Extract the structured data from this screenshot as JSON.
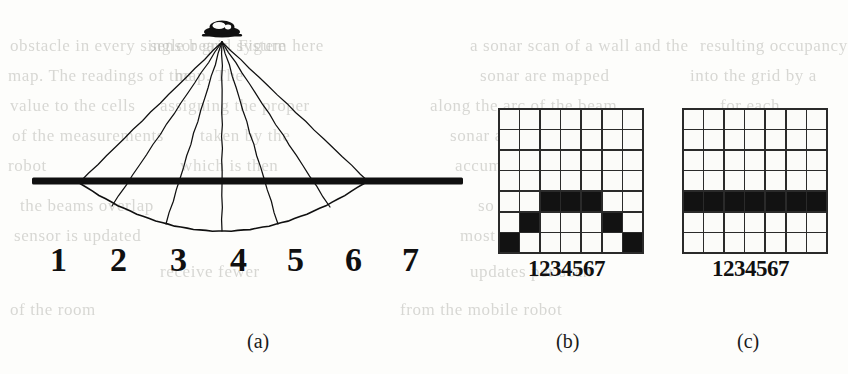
{
  "figure": {
    "background_color": "#fdfdfb",
    "ink_color": "#101010"
  },
  "ghost_text": {
    "note": "faint illegible show-through text from reverse side of scanned page",
    "lines": [
      {
        "text": "obstacle in every single beam. Figure",
        "x": 10,
        "y": 36
      },
      {
        "text": "sensor grid system here",
        "x": 150,
        "y": 36
      },
      {
        "text": "a sonar scan of a wall and the",
        "x": 470,
        "y": 36
      },
      {
        "text": "resulting occupancy",
        "x": 700,
        "y": 36
      },
      {
        "text": "map. The readings of the",
        "x": 8,
        "y": 66
      },
      {
        "text": "map. The",
        "x": 175,
        "y": 66
      },
      {
        "text": "sonar are mapped",
        "x": 480,
        "y": 66
      },
      {
        "text": "into the grid by a",
        "x": 690,
        "y": 66
      },
      {
        "text": "value to the cells",
        "x": 10,
        "y": 96
      },
      {
        "text": "assigning the proper",
        "x": 160,
        "y": 96
      },
      {
        "text": "along the arc of the beam",
        "x": 430,
        "y": 96
      },
      {
        "text": "for each",
        "x": 720,
        "y": 96
      },
      {
        "text": "of the measurements",
        "x": 12,
        "y": 126
      },
      {
        "text": "taken by the",
        "x": 200,
        "y": 126
      },
      {
        "text": "sonar at a given position",
        "x": 450,
        "y": 126
      },
      {
        "text": "of the",
        "x": 728,
        "y": 126
      },
      {
        "text": "robot",
        "x": 8,
        "y": 156
      },
      {
        "text": "which is then",
        "x": 180,
        "y": 156
      },
      {
        "text": "accumulated over time",
        "x": 455,
        "y": 156
      },
      {
        "text": "into the map",
        "x": 706,
        "y": 156
      },
      {
        "text": "the beams overlap",
        "x": 20,
        "y": 196
      },
      {
        "text": "so that the region",
        "x": 478,
        "y": 196
      },
      {
        "text": "nearest the",
        "x": 712,
        "y": 196
      },
      {
        "text": "sensor is updated",
        "x": 14,
        "y": 226
      },
      {
        "text": "most often and the",
        "x": 460,
        "y": 226
      },
      {
        "text": "far cells",
        "x": 730,
        "y": 226
      },
      {
        "text": "receive fewer",
        "x": 160,
        "y": 262
      },
      {
        "text": "updates per scan",
        "x": 470,
        "y": 262
      },
      {
        "text": "of the room",
        "x": 10,
        "y": 300
      },
      {
        "text": "from the mobile robot",
        "x": 400,
        "y": 300
      }
    ]
  },
  "panel_a": {
    "name": "sonar-beam-fan-diagram",
    "emitter": {
      "label": "sonar-transducer",
      "x": 222,
      "y": 30
    },
    "surface_bar": {
      "x1": 32,
      "x2": 463,
      "y": 181,
      "thickness": 7
    },
    "arc": {
      "center_x": 222,
      "surface_y": 181,
      "deepest_y": 231,
      "left_x": 80,
      "right_x": 370
    },
    "beam_count": 7,
    "beam_endpoints_on_arc": [
      {
        "index": 1,
        "x": 80,
        "y": 182
      },
      {
        "index": 2,
        "x": 112,
        "y": 206
      },
      {
        "index": 3,
        "x": 166,
        "y": 224
      },
      {
        "index": 4,
        "x": 222,
        "y": 231
      },
      {
        "index": 5,
        "x": 278,
        "y": 224
      },
      {
        "index": 6,
        "x": 330,
        "y": 207
      },
      {
        "index": 7,
        "x": 370,
        "y": 183
      }
    ],
    "scale_labels": [
      {
        "text": "1",
        "x": 16
      },
      {
        "text": "2",
        "x": 76
      },
      {
        "text": "3",
        "x": 136
      },
      {
        "text": "4",
        "x": 196
      },
      {
        "text": "5",
        "x": 253
      },
      {
        "text": "6",
        "x": 311
      },
      {
        "text": "7",
        "x": 368
      }
    ]
  },
  "panel_b": {
    "name": "occupancy-grid-arc",
    "rows": 7,
    "cols": 7,
    "column_labels": "1234567",
    "cells": [
      [
        0,
        0,
        0,
        0,
        0,
        0,
        0
      ],
      [
        0,
        0,
        0,
        0,
        0,
        0,
        0
      ],
      [
        0,
        0,
        0,
        0,
        0,
        0,
        0
      ],
      [
        0,
        0,
        0,
        0,
        0,
        0,
        0
      ],
      [
        0,
        0,
        1,
        1,
        1,
        0,
        0
      ],
      [
        0,
        1,
        0,
        0,
        0,
        1,
        0
      ],
      [
        1,
        0,
        0,
        0,
        0,
        0,
        1
      ]
    ]
  },
  "panel_c": {
    "name": "occupancy-grid-flat",
    "rows": 7,
    "cols": 7,
    "column_labels": "1234567",
    "cells": [
      [
        0,
        0,
        0,
        0,
        0,
        0,
        0
      ],
      [
        0,
        0,
        0,
        0,
        0,
        0,
        0
      ],
      [
        0,
        0,
        0,
        0,
        0,
        0,
        0
      ],
      [
        0,
        0,
        0,
        0,
        0,
        0,
        0
      ],
      [
        1,
        1,
        1,
        1,
        1,
        1,
        1
      ],
      [
        0,
        0,
        0,
        0,
        0,
        0,
        0
      ],
      [
        0,
        0,
        0,
        0,
        0,
        0,
        0
      ]
    ]
  },
  "captions": {
    "a": {
      "text": "(a)",
      "x": 247,
      "y": 330
    },
    "b": {
      "text": "(b)",
      "x": 556,
      "y": 330
    },
    "c": {
      "text": "(c)",
      "x": 737,
      "y": 330
    }
  }
}
